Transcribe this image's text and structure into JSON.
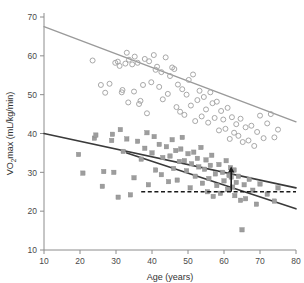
{
  "chart_data": {
    "type": "scatter",
    "title": "",
    "xlabel": "Age (years)",
    "ylabel": "Vo2max (mL/kg/min)",
    "ylabel_parts": {
      "pre": "V",
      "sub": "O",
      "sub2": "2",
      "post": "max (mL/kg/min)"
    },
    "xlim": [
      10,
      80
    ],
    "ylim": [
      10,
      70
    ],
    "xticks": [
      10,
      20,
      30,
      40,
      50,
      60,
      70,
      80
    ],
    "yticks": [
      10,
      20,
      30,
      40,
      50,
      60,
      70
    ],
    "grid": false,
    "legend": "none",
    "colors": {
      "circle_marker": "#a8a8a8",
      "square_marker": "#9d9d9d",
      "upper_trend": "#9a9a9a",
      "lower_trend": "#3a3a3a",
      "second_trend": "#3a3a3a",
      "dashed_line": "#1a1a1a",
      "arrow": "#1a1a1a",
      "axis": "#8c8c8c"
    },
    "series": [
      {
        "name": "circles",
        "marker": "open-circle",
        "color": "#a8a8a8",
        "points": [
          [
            23.5,
            58.8
          ],
          [
            25.8,
            52.5
          ],
          [
            27.0,
            50.5
          ],
          [
            28.2,
            52.8
          ],
          [
            29.8,
            58.2
          ],
          [
            30.5,
            58.5
          ],
          [
            31.0,
            57.4
          ],
          [
            31.6,
            50.6
          ],
          [
            31.8,
            51.2
          ],
          [
            32.6,
            58.0
          ],
          [
            33.0,
            60.8
          ],
          [
            33.4,
            48.0
          ],
          [
            33.6,
            59.0
          ],
          [
            34.5,
            57.8
          ],
          [
            35.0,
            50.8
          ],
          [
            35.2,
            59.8
          ],
          [
            36.0,
            58.2
          ],
          [
            36.4,
            47.6
          ],
          [
            36.8,
            48.4
          ],
          [
            37.5,
            52.5
          ],
          [
            38.0,
            59.2
          ],
          [
            38.6,
            45.2
          ],
          [
            39.2,
            58.6
          ],
          [
            39.8,
            53.2
          ],
          [
            40.5,
            60.2
          ],
          [
            41.0,
            56.4
          ],
          [
            41.4,
            57.2
          ],
          [
            42.0,
            52.0
          ],
          [
            42.6,
            55.8
          ],
          [
            43.0,
            48.8
          ],
          [
            43.8,
            59.6
          ],
          [
            44.4,
            50.2
          ],
          [
            45.0,
            54.8
          ],
          [
            45.6,
            57.0
          ],
          [
            46.2,
            56.6
          ],
          [
            46.8,
            46.8
          ],
          [
            47.2,
            52.6
          ],
          [
            47.8,
            45.6
          ],
          [
            48.4,
            51.4
          ],
          [
            49.0,
            44.8
          ],
          [
            49.6,
            50.0
          ],
          [
            50.2,
            53.8
          ],
          [
            50.8,
            47.2
          ],
          [
            51.4,
            55.2
          ],
          [
            52.0,
            43.2
          ],
          [
            52.6,
            48.6
          ],
          [
            53.2,
            51.0
          ],
          [
            53.8,
            44.4
          ],
          [
            54.4,
            49.4
          ],
          [
            55.0,
            46.2
          ],
          [
            55.6,
            42.8
          ],
          [
            56.2,
            50.6
          ],
          [
            56.8,
            47.8
          ],
          [
            57.4,
            44.0
          ],
          [
            58.0,
            48.2
          ],
          [
            58.6,
            40.8
          ],
          [
            59.2,
            45.8
          ],
          [
            59.8,
            43.6
          ],
          [
            60.4,
            41.2
          ],
          [
            61.0,
            46.6
          ],
          [
            61.6,
            38.6
          ],
          [
            62.2,
            44.2
          ],
          [
            62.8,
            40.2
          ],
          [
            63.4,
            42.4
          ],
          [
            64.0,
            39.4
          ],
          [
            64.6,
            43.8
          ],
          [
            65.2,
            37.8
          ],
          [
            66.0,
            41.6
          ],
          [
            66.8,
            38.2
          ],
          [
            67.6,
            42.0
          ],
          [
            68.4,
            36.8
          ],
          [
            69.2,
            40.4
          ],
          [
            70.0,
            44.6
          ],
          [
            71.0,
            38.8
          ],
          [
            72.0,
            42.6
          ],
          [
            73.0,
            45.0
          ],
          [
            74.0,
            39.0
          ],
          [
            75.0,
            41.0
          ]
        ]
      },
      {
        "name": "squares",
        "marker": "filled-square",
        "color": "#9d9d9d",
        "points": [
          [
            19.6,
            34.6
          ],
          [
            20.8,
            29.8
          ],
          [
            24.0,
            38.8
          ],
          [
            24.4,
            39.6
          ],
          [
            26.2,
            26.4
          ],
          [
            26.6,
            30.2
          ],
          [
            28.8,
            38.2
          ],
          [
            29.0,
            39.8
          ],
          [
            29.4,
            30.0
          ],
          [
            30.6,
            23.6
          ],
          [
            31.2,
            41.0
          ],
          [
            32.0,
            35.4
          ],
          [
            33.0,
            38.6
          ],
          [
            34.0,
            24.2
          ],
          [
            35.0,
            28.6
          ],
          [
            36.0,
            38.0
          ],
          [
            37.0,
            33.4
          ],
          [
            38.0,
            36.2
          ],
          [
            38.6,
            40.2
          ],
          [
            39.0,
            26.8
          ],
          [
            40.0,
            35.0
          ],
          [
            40.6,
            39.2
          ],
          [
            41.0,
            30.6
          ],
          [
            42.0,
            37.2
          ],
          [
            42.6,
            29.4
          ],
          [
            43.0,
            33.8
          ],
          [
            44.0,
            36.6
          ],
          [
            44.6,
            27.6
          ],
          [
            45.0,
            34.2
          ],
          [
            45.6,
            38.4
          ],
          [
            46.0,
            31.0
          ],
          [
            46.6,
            35.6
          ],
          [
            47.0,
            28.0
          ],
          [
            47.6,
            32.8
          ],
          [
            48.0,
            36.0
          ],
          [
            48.4,
            39.0
          ],
          [
            49.0,
            33.0
          ],
          [
            49.6,
            30.4
          ],
          [
            50.0,
            34.8
          ],
          [
            50.6,
            26.0
          ],
          [
            51.0,
            32.2
          ],
          [
            51.6,
            35.2
          ],
          [
            52.0,
            29.0
          ],
          [
            52.6,
            33.6
          ],
          [
            53.0,
            31.4
          ],
          [
            53.6,
            36.4
          ],
          [
            54.0,
            27.2
          ],
          [
            54.6,
            30.8
          ],
          [
            55.0,
            33.2
          ],
          [
            55.4,
            25.0
          ],
          [
            55.8,
            28.4
          ],
          [
            56.2,
            31.8
          ],
          [
            56.6,
            34.4
          ],
          [
            57.0,
            23.8
          ],
          [
            57.6,
            29.6
          ],
          [
            58.0,
            26.6
          ],
          [
            58.6,
            32.0
          ],
          [
            59.0,
            24.6
          ],
          [
            59.6,
            30.0
          ],
          [
            60.0,
            27.8
          ],
          [
            60.6,
            33.0
          ],
          [
            61.0,
            25.6
          ],
          [
            61.4,
            29.2
          ],
          [
            61.8,
            31.2
          ],
          [
            62.0,
            28.8
          ],
          [
            62.4,
            26.2
          ],
          [
            62.8,
            30.6
          ],
          [
            63.0,
            24.0
          ],
          [
            63.4,
            27.4
          ],
          [
            64.0,
            29.0
          ],
          [
            64.6,
            22.8
          ],
          [
            65.0,
            15.2
          ],
          [
            65.6,
            26.8
          ],
          [
            66.0,
            23.2
          ],
          [
            67.0,
            28.2
          ],
          [
            68.0,
            25.4
          ],
          [
            69.0,
            21.8
          ],
          [
            70.0,
            27.0
          ],
          [
            72.0,
            24.4
          ],
          [
            74.0,
            22.6
          ],
          [
            75.0,
            26.0
          ]
        ]
      }
    ],
    "trend_lines": [
      {
        "name": "upper-trend-line",
        "style": "solid",
        "color": "#9a9a9a",
        "width": 1.4,
        "x1": 10,
        "y1": 67.5,
        "x2": 80,
        "y2": 43.0
      },
      {
        "name": "lower-trend-line",
        "style": "solid",
        "color": "#3a3a3a",
        "width": 1.6,
        "x1": 10,
        "y1": 40.0,
        "x2": 80,
        "y2": 26.0
      },
      {
        "name": "second-trend-line",
        "style": "solid",
        "color": "#3a3a3a",
        "width": 1.6,
        "x1": 33,
        "y1": 35.0,
        "x2": 80,
        "y2": 20.6
      }
    ],
    "annotations": [
      {
        "name": "threshold-dashed-line",
        "type": "hline",
        "y": 25.0,
        "x1": 37,
        "x2": 80,
        "style": "dashed",
        "color": "#1a1a1a"
      },
      {
        "name": "difference-arrow",
        "type": "arrow",
        "x": 62.0,
        "y_from": 25.0,
        "y_to": 31.5,
        "color": "#1a1a1a"
      }
    ]
  }
}
